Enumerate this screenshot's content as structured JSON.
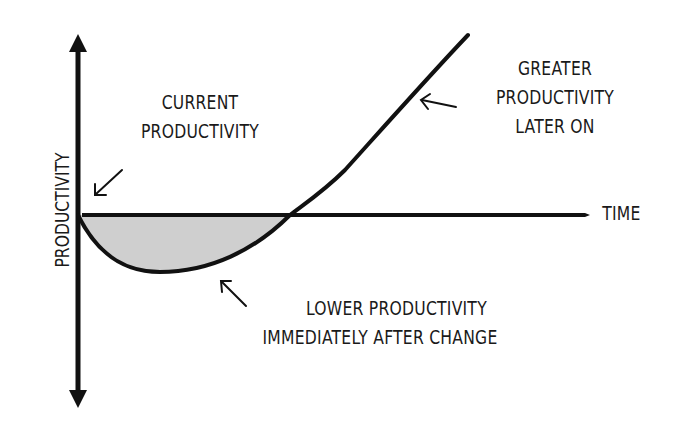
{
  "diagram": {
    "y_axis_label": "PRODUCTIVITY",
    "x_axis_label": "TIME",
    "annotations": {
      "current": {
        "line1": "CURRENT",
        "line2": "PRODUCTIVITY"
      },
      "greater": {
        "line1": "GREATER",
        "line2": "PRODUCTIVITY",
        "line3": "LATER ON"
      },
      "lower": {
        "line1": "LOWER PRODUCTIVITY",
        "line2": "IMMEDIATELY AFTER CHANGE"
      }
    },
    "colors": {
      "stroke": "#111111",
      "shaded_area": "#cfcfcf",
      "background": "#ffffff"
    }
  }
}
